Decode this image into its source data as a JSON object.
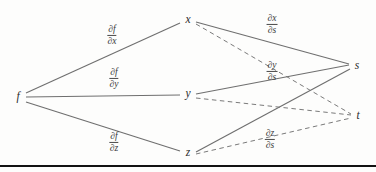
{
  "figure": {
    "background_color": "#fdfdfc",
    "solid_edge_color": "#6f6f6f",
    "dashed_edge_color": "#7a7a7a",
    "text_color": "#2b2b2b",
    "rule_color": "#121212"
  },
  "nodes": [
    {
      "id": "f",
      "label": "f",
      "x": 18,
      "y": 97
    },
    {
      "id": "x",
      "label": "x",
      "x": 188,
      "y": 20
    },
    {
      "id": "y",
      "label": "y",
      "x": 188,
      "y": 94
    },
    {
      "id": "z",
      "label": "z",
      "x": 188,
      "y": 153
    },
    {
      "id": "s",
      "label": "s",
      "x": 357,
      "y": 66
    },
    {
      "id": "t",
      "label": "t",
      "x": 358,
      "y": 116
    }
  ],
  "edges": [
    {
      "id": "f-x",
      "from": "f",
      "to": "x",
      "style": "solid"
    },
    {
      "id": "f-y",
      "from": "f",
      "to": "y",
      "style": "solid"
    },
    {
      "id": "f-z",
      "from": "f",
      "to": "z",
      "style": "solid"
    },
    {
      "id": "x-s",
      "from": "x",
      "to": "s",
      "style": "solid"
    },
    {
      "id": "x-t",
      "from": "x",
      "to": "t",
      "style": "dashed"
    },
    {
      "id": "y-s",
      "from": "y",
      "to": "s",
      "style": "solid"
    },
    {
      "id": "y-t",
      "from": "y",
      "to": "t",
      "style": "dashed"
    },
    {
      "id": "z-s",
      "from": "z",
      "to": "s",
      "style": "solid"
    },
    {
      "id": "z-t",
      "from": "z",
      "to": "t",
      "style": "dashed"
    }
  ],
  "edge_labels": [
    {
      "id": "df-dx",
      "numerator": "∂f",
      "denominator": "∂x",
      "x": 112,
      "y": 35
    },
    {
      "id": "df-dy",
      "numerator": "∂f",
      "denominator": "∂y",
      "x": 114,
      "y": 78
    },
    {
      "id": "df-dz",
      "numerator": "∂f",
      "denominator": "∂z",
      "x": 114,
      "y": 142
    },
    {
      "id": "dx-ds",
      "numerator": "∂x",
      "denominator": "∂s",
      "x": 272,
      "y": 24
    },
    {
      "id": "dy-ds",
      "numerator": "∂y",
      "denominator": "∂s",
      "x": 272,
      "y": 71
    },
    {
      "id": "dz-ds",
      "numerator": "∂z",
      "denominator": "∂s",
      "x": 270,
      "y": 139
    }
  ]
}
